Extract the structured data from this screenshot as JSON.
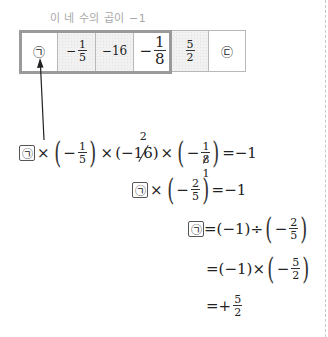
{
  "label": "이 네 수의 곱이 −1",
  "strip": {
    "cells": [
      {
        "type": "symbol",
        "text": "㉠",
        "shaded": false
      },
      {
        "type": "frac",
        "sign": "−",
        "num": "1",
        "den": "5",
        "shaded": true
      },
      {
        "type": "text",
        "text": "−16",
        "shaded": true
      },
      {
        "type": "frac",
        "sign": "−",
        "num": "1",
        "den": "8",
        "shaded": false
      },
      {
        "type": "frac",
        "sign": "",
        "num": "5",
        "den": "2",
        "shaded": true
      },
      {
        "type": "symbol",
        "text": "㉢",
        "shaded": false
      }
    ],
    "group_label": "first four cells"
  },
  "unknown_symbol": "㉠",
  "equations": {
    "line1": {
      "times": "×",
      "f1_sign": "−",
      "f1_num": "1",
      "f1_den": "5",
      "neg16_prefix": "(−",
      "neg16_value": "16",
      "neg16_suffix": ")",
      "neg16_reduced": "2",
      "f3_sign": "−",
      "f3_num": "1",
      "f3_den": "8",
      "f3_reduced": "1",
      "rhs": "=−1"
    },
    "line2": {
      "times": "×",
      "sign": "−",
      "num": "2",
      "den": "5",
      "rhs": "=−1"
    },
    "line3": {
      "eq": "=(−1)÷",
      "sign": "−",
      "num": "2",
      "den": "5"
    },
    "line4": {
      "eq": "=(−1)×",
      "sign": "−",
      "num": "5",
      "den": "2"
    },
    "line5": {
      "eq": "=+",
      "num": "5",
      "den": "2"
    }
  },
  "colors": {
    "label": "#a8a8a8",
    "group_border": "#9a9a9a",
    "cell_border": "#b8b8b8",
    "shaded_bg": "#f1f1f1",
    "divider": "#c8c8c8"
  }
}
